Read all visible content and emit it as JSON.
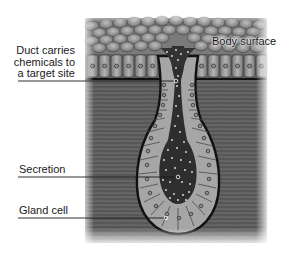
{
  "diagram": {
    "labels": {
      "duct": "Duct carries chemicals to a target site",
      "duct_lines": [
        "Duct carries",
        "chemicals to",
        "a target site"
      ],
      "body_surface": "Body surface",
      "secretion": "Secretion",
      "gland_cell": "Gland cell"
    },
    "colors": {
      "tissue": "#5a5a5a",
      "cell": "#a8a8a8",
      "lumen": "#2e2e2e",
      "outline": "#111111",
      "secretion_dots": "#e8e8e8",
      "label_text": "#1a1a1a"
    }
  }
}
